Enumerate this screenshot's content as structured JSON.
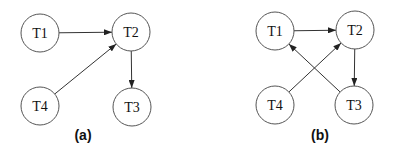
{
  "diagrams": [
    {
      "caption": "(a)",
      "nodes": [
        {
          "id": "T1",
          "label": "T1",
          "x": 40,
          "y": 33
        },
        {
          "id": "T2",
          "label": "T2",
          "x": 131,
          "y": 32
        },
        {
          "id": "T4",
          "label": "T4",
          "x": 40,
          "y": 106
        },
        {
          "id": "T3",
          "label": "T3",
          "x": 132,
          "y": 107
        }
      ],
      "edges": [
        {
          "from": "T1",
          "to": "T2"
        },
        {
          "from": "T4",
          "to": "T2"
        },
        {
          "from": "T2",
          "to": "T3"
        }
      ]
    },
    {
      "caption": "(b)",
      "nodes": [
        {
          "id": "T1",
          "label": "T1",
          "x": 275,
          "y": 31
        },
        {
          "id": "T2",
          "label": "T2",
          "x": 355,
          "y": 30
        },
        {
          "id": "T4",
          "label": "T4",
          "x": 275,
          "y": 105
        },
        {
          "id": "T3",
          "label": "T3",
          "x": 354,
          "y": 105
        }
      ],
      "edges": [
        {
          "from": "T1",
          "to": "T2"
        },
        {
          "from": "T4",
          "to": "T2"
        },
        {
          "from": "T2",
          "to": "T3"
        },
        {
          "from": "T3",
          "to": "T1"
        }
      ]
    }
  ],
  "style": {
    "node_radius": 19,
    "stroke": "#555555",
    "edge": "#333333"
  }
}
